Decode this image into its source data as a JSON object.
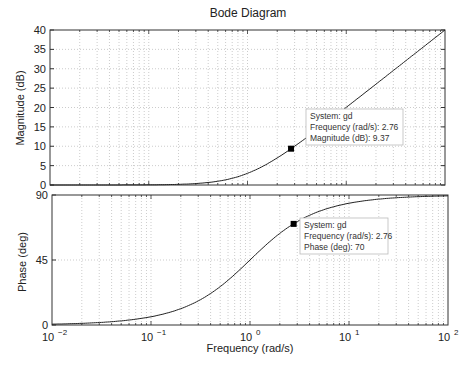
{
  "chart_data": [
    {
      "type": "line",
      "title": "Bode Diagram",
      "panel": "magnitude",
      "xlabel": "Frequency (rad/s)",
      "ylabel": "Magnitude (dB)",
      "xscale": "log",
      "xlim": [
        0.01,
        100
      ],
      "ylim": [
        0,
        40
      ],
      "yticks": [
        0,
        5,
        10,
        15,
        20,
        25,
        30,
        35,
        40
      ],
      "grid": true,
      "series": [
        {
          "name": "gd",
          "x": [
            0.01,
            0.03,
            0.1,
            0.3,
            1,
            2.76,
            10,
            30,
            100
          ],
          "y": [
            0.0,
            0.0,
            0.04,
            0.37,
            3.01,
            9.37,
            20.04,
            29.55,
            40.0
          ]
        }
      ],
      "annotations": [
        {
          "type": "datatip",
          "x": 2.76,
          "y": 9.37,
          "lines": [
            "System: gd",
            "Frequency (rad/s): 2.76",
            "Magnitude (dB): 9.37"
          ]
        }
      ]
    },
    {
      "type": "line",
      "panel": "phase",
      "xlabel": "Frequency (rad/s)",
      "ylabel": "Phase (deg)",
      "xscale": "log",
      "xlim": [
        0.01,
        100
      ],
      "ylim": [
        0,
        90
      ],
      "yticks": [
        0,
        45,
        90
      ],
      "xticks": [
        "10^-2",
        "10^-1",
        "10^0",
        "10^1",
        "10^2"
      ],
      "grid": true,
      "series": [
        {
          "name": "gd",
          "x": [
            0.01,
            0.03,
            0.1,
            0.3,
            1,
            2.76,
            10,
            30,
            100
          ],
          "y": [
            0.57,
            1.72,
            5.71,
            16.7,
            45.0,
            70.0,
            84.3,
            88.1,
            89.4
          ]
        }
      ],
      "annotations": [
        {
          "type": "datatip",
          "x": 2.76,
          "y": 70,
          "lines": [
            "System: gd",
            "Frequency (rad/s): 2.76",
            "Phase (deg): 70"
          ]
        }
      ]
    }
  ],
  "figure": {
    "title": "Bode Diagram",
    "xlabel": "Frequency (rad/s)",
    "mag_ylabel": "Magnitude (dB)",
    "phase_ylabel": "Phase (deg)",
    "mag_yticks": [
      "0",
      "5",
      "10",
      "15",
      "20",
      "25",
      "30",
      "35",
      "40"
    ],
    "phase_yticks": [
      "0",
      "45",
      "90"
    ],
    "xtick_base": "10",
    "xtick_exps": [
      "−2",
      "−1",
      "0",
      "1",
      "2"
    ],
    "mag_tip": [
      "System: gd",
      "Frequency (rad/s): 2.76",
      "Magnitude (dB): 9.37"
    ],
    "phase_tip": [
      "System: gd",
      "Frequency (rad/s): 2.76",
      "Phase (deg): 70"
    ]
  }
}
